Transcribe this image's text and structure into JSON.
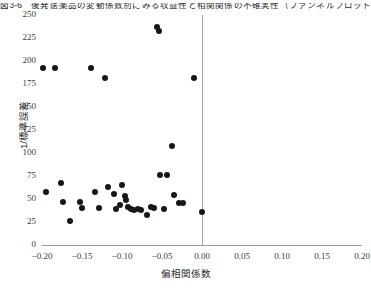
{
  "caption": {
    "text": "図3-6　後発医薬品の変動係数別にみる収益性と相関関係の不確実性（ファンネルプロット）"
  },
  "chart_data": {
    "type": "scatter",
    "title": "",
    "xlabel": "偏相関係数",
    "ylabel": "1/標準誤差",
    "xlim": [
      -0.2,
      0.2
    ],
    "ylim": [
      0,
      250
    ],
    "xticks": [
      "-0.20",
      "-0.15",
      "-0.10",
      "-0.05",
      "0.00",
      "0.05",
      "0.10",
      "0.15",
      "0.20"
    ],
    "xtick_values": [
      -0.2,
      -0.15,
      -0.1,
      -0.05,
      0.0,
      0.05,
      0.1,
      0.15,
      0.2
    ],
    "yticks": [
      "0",
      "25",
      "50",
      "75",
      "100",
      "125",
      "150",
      "175",
      "200",
      "225",
      "250"
    ],
    "ytick_values": [
      0,
      25,
      50,
      75,
      100,
      125,
      150,
      175,
      200,
      225,
      250
    ],
    "grid": false,
    "legend": null,
    "reference_line": {
      "orientation": "vertical",
      "x": 0.0,
      "color": "#a9a9a9"
    },
    "marker": {
      "shape": "circle",
      "color": "#1a1516",
      "size": 6
    },
    "points": [
      {
        "x": -0.1987,
        "y": 192
      },
      {
        "x": -0.1838,
        "y": 192
      },
      {
        "x": -0.195,
        "y": 58
      },
      {
        "x": -0.1739,
        "y": 47
      },
      {
        "x": -0.1764,
        "y": 67
      },
      {
        "x": -0.1652,
        "y": 26
      },
      {
        "x": -0.1528,
        "y": 47
      },
      {
        "x": -0.1503,
        "y": 40
      },
      {
        "x": -0.1391,
        "y": 192
      },
      {
        "x": -0.1342,
        "y": 58
      },
      {
        "x": -0.1291,
        "y": 40
      },
      {
        "x": -0.1217,
        "y": 181
      },
      {
        "x": -0.118,
        "y": 63
      },
      {
        "x": -0.1105,
        "y": 55
      },
      {
        "x": -0.108,
        "y": 39
      },
      {
        "x": -0.1031,
        "y": 44
      },
      {
        "x": -0.0994,
        "y": 65
      },
      {
        "x": -0.0957,
        "y": 53
      },
      {
        "x": -0.0944,
        "y": 49
      },
      {
        "x": -0.0919,
        "y": 41
      },
      {
        "x": -0.0882,
        "y": 39
      },
      {
        "x": -0.0845,
        "y": 38
      },
      {
        "x": -0.0795,
        "y": 39
      },
      {
        "x": -0.0758,
        "y": 38
      },
      {
        "x": -0.0683,
        "y": 33
      },
      {
        "x": -0.0634,
        "y": 41
      },
      {
        "x": -0.0596,
        "y": 40
      },
      {
        "x": -0.0559,
        "y": 237
      },
      {
        "x": -0.0534,
        "y": 233
      },
      {
        "x": -0.0522,
        "y": 76
      },
      {
        "x": -0.0435,
        "y": 76
      },
      {
        "x": -0.0472,
        "y": 39
      },
      {
        "x": -0.0373,
        "y": 108
      },
      {
        "x": -0.0348,
        "y": 54
      },
      {
        "x": -0.0286,
        "y": 46
      },
      {
        "x": -0.0236,
        "y": 46
      },
      {
        "x": -0.0099,
        "y": 181
      },
      {
        "x": 0.0,
        "y": 36
      }
    ]
  }
}
